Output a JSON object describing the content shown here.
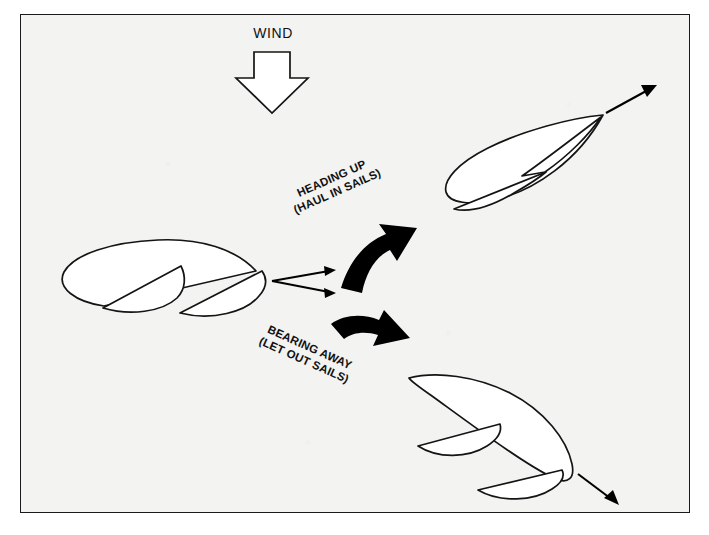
{
  "diagram": {
    "background_color": "#f3f3f1",
    "border_color": "#1a1a1a",
    "ink_color": "#141414"
  },
  "wind": {
    "label": "WIND",
    "direction": "down",
    "arrow_icon": "wind-arrow-down-icon"
  },
  "labels": {
    "heading_up": {
      "line1": "HEADING UP",
      "line2": "(HAUL IN SAILS)",
      "rotation_deg": -24
    },
    "bearing_away": {
      "line1": "BEARING AWAY",
      "line2": "(LET OUT SAILS)",
      "rotation_deg": 24
    }
  },
  "boats": [
    {
      "id": "boat-start",
      "name": "boat-reaching-start",
      "position": "center-left",
      "heading": "east",
      "sail_trim": "mid",
      "description": "Sailboat on a beam reach sailing to the right with sails part way out"
    },
    {
      "id": "boat-upwind",
      "name": "boat-heading-up",
      "position": "top-right",
      "heading": "north-east",
      "sail_trim": "hauled-in",
      "description": "Sailboat heading up with sails hauled in tight"
    },
    {
      "id": "boat-downwind",
      "name": "boat-bearing-away",
      "position": "bottom-right",
      "heading": "south-east",
      "sail_trim": "let-out",
      "description": "Sailboat bearing away with sails let out wide"
    }
  ],
  "arrows": {
    "curved_up": {
      "name": "curved-arrow-heading-up",
      "style": "bold-swoosh",
      "direction": "up-right",
      "color": "#000000"
    },
    "curved_down": {
      "name": "curved-arrow-bearing-away",
      "style": "bold-swoosh",
      "direction": "down-right",
      "color": "#000000"
    },
    "split_up": {
      "name": "course-arrow-up",
      "style": "thin",
      "direction": "up-right"
    },
    "split_down": {
      "name": "course-arrow-down",
      "style": "thin",
      "direction": "down-right"
    },
    "heading_upwind": {
      "name": "course-arrow-upwind",
      "style": "thin",
      "direction": "up-right"
    },
    "heading_downwind": {
      "name": "course-arrow-downwind",
      "style": "thin",
      "direction": "down-right"
    }
  }
}
